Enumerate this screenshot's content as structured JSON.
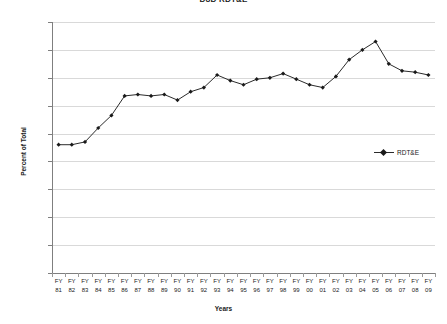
{
  "chart_data": {
    "type": "line",
    "title": "DoD RDT&E",
    "xlabel": "Years",
    "ylabel": "Percent of Total",
    "ylim": [
      0,
      0.18
    ],
    "ytick_labels": [
      "0.18",
      "0.16",
      "0.14",
      "0.12",
      "0.1",
      "0.08",
      "0.06",
      "0.04",
      "0.02",
      "0"
    ],
    "ytick_values": [
      0.18,
      0.16,
      0.14,
      0.12,
      0.1,
      0.08,
      0.06,
      0.04,
      0.02,
      0
    ],
    "grid": true,
    "legend_position": "middle-right",
    "marker": "diamond",
    "line_color": "#2b2b2b",
    "marker_color": "#1a1a1a",
    "grid_color": "#d9d9d9",
    "categories": [
      "FY 81",
      "FY 82",
      "FY 83",
      "FY 84",
      "FY 85",
      "FY 86",
      "FY 87",
      "FY 88",
      "FY 89",
      "FY 90",
      "FY 91",
      "FY 92",
      "FY 93",
      "FY 94",
      "FY 95",
      "FY 96",
      "FY 97",
      "FY 98",
      "FY 99",
      "FY 00",
      "FY 01",
      "FY 02",
      "FY 03",
      "FY 04",
      "FY 05",
      "FY 06",
      "FY 07",
      "FY 08",
      "FY 09"
    ],
    "categories_top": [
      "FY",
      "FY",
      "FY",
      "FY",
      "FY",
      "FY",
      "FY",
      "FY",
      "FY",
      "FY",
      "FY",
      "FY",
      "FY",
      "FY",
      "FY",
      "FY",
      "FY",
      "FY",
      "FY",
      "FY",
      "FY",
      "FY",
      "FY",
      "FY",
      "FY",
      "FY",
      "FY",
      "FY",
      "FY"
    ],
    "categories_bottom": [
      "81",
      "82",
      "83",
      "84",
      "85",
      "86",
      "87",
      "88",
      "89",
      "90",
      "91",
      "92",
      "93",
      "94",
      "95",
      "96",
      "97",
      "98",
      "99",
      "00",
      "01",
      "02",
      "03",
      "04",
      "05",
      "06",
      "07",
      "08",
      "09"
    ],
    "series": [
      {
        "name": "RDT&E",
        "values": [
          0.092,
          0.092,
          0.094,
          0.104,
          0.113,
          0.127,
          0.128,
          0.127,
          0.128,
          0.124,
          0.13,
          0.133,
          0.142,
          0.138,
          0.135,
          0.139,
          0.14,
          0.143,
          0.139,
          0.135,
          0.133,
          0.141,
          0.153,
          0.16,
          0.166,
          0.15,
          0.145,
          0.144,
          0.142
        ]
      }
    ]
  },
  "legend": {
    "entries": [
      {
        "label": "RDT&E"
      }
    ]
  }
}
